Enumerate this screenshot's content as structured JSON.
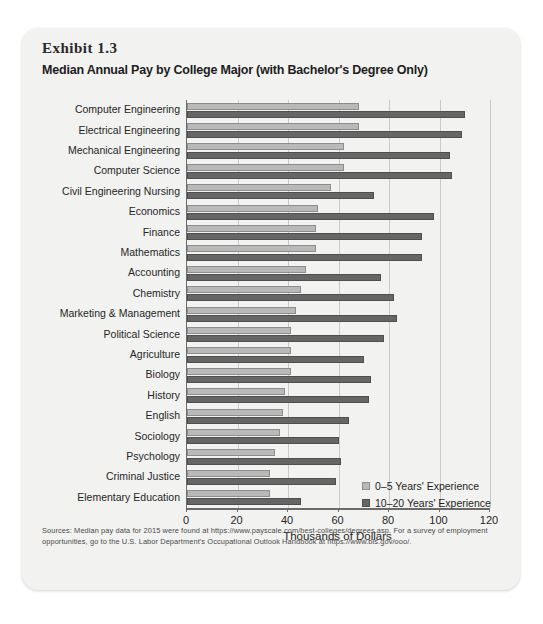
{
  "exhibit": {
    "number": "Exhibit 1.3",
    "title": "Median Annual Pay by College Major (with Bachelor's Degree Only)",
    "source_note": "Sources: Median pay data for 2015 were found at https://www.payscale.com/best-colleges/degrees.asp. For a survey of employment opportunities, go to the U.S. Labor Department's Occupational Outlook Handbook at https://www.bls.gov/ooo/."
  },
  "chart_data": {
    "type": "bar",
    "orientation": "horizontal",
    "title": "Median Annual Pay by College Major (with Bachelor's Degree Only)",
    "xlabel": "Thousands of Dollars",
    "ylabel": "",
    "xlim": [
      0,
      120
    ],
    "xticks": [
      0,
      20,
      40,
      60,
      80,
      100,
      120
    ],
    "grid": "vertical",
    "legend_position": "inside-bottom-right",
    "categories": [
      "Computer Engineering",
      "Electrical Engineering",
      "Mechanical Engineering",
      "Computer Science",
      "Civil Engineering Nursing",
      "Economics",
      "Finance",
      "Mathematics",
      "Accounting",
      "Chemistry",
      "Marketing & Management",
      "Political Science",
      "Agriculture",
      "Biology",
      "History",
      "English",
      "Sociology",
      "Psychology",
      "Criminal Justice",
      "Elementary Education"
    ],
    "series": [
      {
        "name": "0–5 Years' Experience",
        "color": "#b9b9b9",
        "values": [
          68,
          68,
          62,
          62,
          57,
          52,
          51,
          51,
          47,
          45,
          43,
          41,
          41,
          41,
          39,
          38,
          37,
          35,
          33,
          33
        ]
      },
      {
        "name": "10–20 Years' Experience",
        "color": "#666666",
        "values": [
          110,
          109,
          104,
          105,
          74,
          98,
          93,
          93,
          77,
          82,
          83,
          78,
          70,
          73,
          72,
          64,
          60,
          61,
          59,
          45
        ]
      }
    ]
  }
}
